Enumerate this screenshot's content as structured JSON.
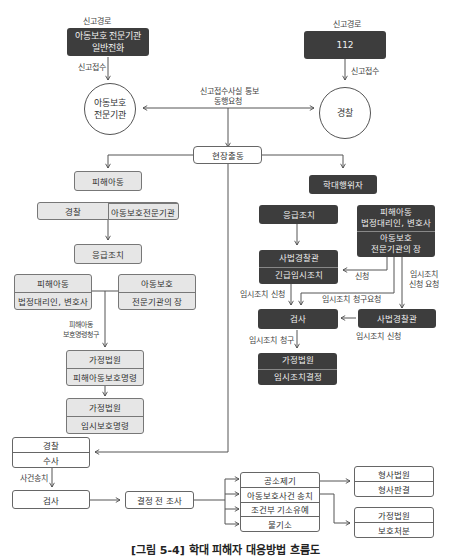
{
  "left_report": {
    "route_label": "신고경로",
    "source_line1": "아동보호 전문기관",
    "source_line2": "일반전화",
    "receive_label": "신고접수",
    "agency_line1": "아동보호",
    "agency_line2": "전문기관"
  },
  "right_report": {
    "route_label": "신고경로",
    "source": "112",
    "receive_label": "신고접수",
    "agency": "경찰"
  },
  "notify_label_line1": "신고접수사실 통보",
  "notify_label_line2": "동행요청",
  "field_dispatch": "현장출동",
  "victim_branch": {
    "victim_child": "피해아동",
    "responders": [
      "경찰",
      "아동보호전문기관"
    ],
    "emergency": "응급조치",
    "guardian_box": [
      "피해아동",
      "법정대리인, 변호사"
    ],
    "agency_head_box": [
      "아동보호",
      "전문기관의 장"
    ],
    "protection_request_line1": "피해아동",
    "protection_request_line2": "보호명령청구",
    "family_court_order": [
      "가정법원",
      "피해아동보호명령"
    ],
    "family_court_temp": [
      "가정법원",
      "임시보호명령"
    ]
  },
  "perpetrator_branch": {
    "perpetrator": "학대행위자",
    "emergency": "응급조치",
    "requesters": {
      "top_line1": "피해아동",
      "top_line2": "법정대리인, 변호사",
      "bottom_line1": "아동보호",
      "bottom_line2": "전문기관의 장"
    },
    "judicial_police_box": [
      "사법경찰관",
      "긴급임시조치"
    ],
    "apply_label": "신청",
    "temp_apply_request_line1": "임시조치",
    "temp_apply_request_line2": "신청 요청",
    "temp_apply_label": "임시조치 신청",
    "temp_claim_request_label": "임시조치 청구요청",
    "prosecutor": "검사",
    "judicial_police": "사법경찰관",
    "judicial_police_apply_label": "임시조치 신청",
    "temp_claim_label": "임시조치 청구",
    "family_court_decision": [
      "가정법원",
      "임시조치결정"
    ]
  },
  "investigation": {
    "police_box": [
      "경찰",
      "수사"
    ],
    "referral_label": "사건송치",
    "prosecutor": "검사",
    "pre_decision": "결정 전 조사",
    "outcomes": [
      "공소제기",
      "아동보호사건 송치",
      "조건부 기소유예",
      "불기소"
    ],
    "criminal_court": [
      "형사법원",
      "형사판결"
    ],
    "family_court": [
      "가정법원",
      "보호처분"
    ]
  },
  "caption": "[그림 5-4] 학대 피해자 대응방법 흐름도"
}
